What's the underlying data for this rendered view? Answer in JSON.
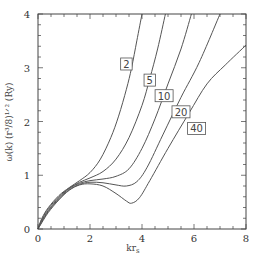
{
  "chart_data": {
    "type": "line",
    "title": "",
    "xlabel": "kr_s",
    "ylabel": "ω(k) (r_s³/8)^{1/2} (Ry)",
    "xlim": [
      0,
      8
    ],
    "ylim": [
      0,
      4
    ],
    "x_ticks": [
      0,
      2,
      4,
      6,
      8
    ],
    "y_ticks": [
      0,
      1,
      2,
      3,
      4
    ],
    "x_minor_step": 0.5,
    "y_minor_step": 0.2,
    "grid": false,
    "legend_position": "inline labels on curves",
    "series": [
      {
        "name": "2",
        "points": [
          [
            0,
            0
          ],
          [
            0.15,
            0.2
          ],
          [
            0.4,
            0.4
          ],
          [
            0.8,
            0.62
          ],
          [
            1.2,
            0.77
          ],
          [
            1.6,
            0.9
          ],
          [
            2.0,
            1.05
          ],
          [
            2.4,
            1.3
          ],
          [
            2.8,
            1.7
          ],
          [
            3.1,
            2.1
          ],
          [
            3.4,
            2.6
          ],
          [
            3.6,
            3.0
          ],
          [
            3.8,
            3.5
          ],
          [
            4.0,
            4.0
          ]
        ],
        "label_at": [
          3.4,
          3.07
        ]
      },
      {
        "name": "5",
        "points": [
          [
            0,
            0
          ],
          [
            0.15,
            0.18
          ],
          [
            0.4,
            0.38
          ],
          [
            0.8,
            0.6
          ],
          [
            1.2,
            0.76
          ],
          [
            1.6,
            0.87
          ],
          [
            2.0,
            0.95
          ],
          [
            2.5,
            1.07
          ],
          [
            3.0,
            1.3
          ],
          [
            3.5,
            1.7
          ],
          [
            4.0,
            2.3
          ],
          [
            4.3,
            2.8
          ],
          [
            4.6,
            3.35
          ],
          [
            4.9,
            4.0
          ]
        ],
        "label_at": [
          4.3,
          2.77
        ]
      },
      {
        "name": "10",
        "points": [
          [
            0,
            0
          ],
          [
            0.15,
            0.16
          ],
          [
            0.4,
            0.35
          ],
          [
            0.8,
            0.58
          ],
          [
            1.2,
            0.75
          ],
          [
            1.6,
            0.85
          ],
          [
            2.0,
            0.9
          ],
          [
            2.5,
            0.93
          ],
          [
            3.0,
            0.98
          ],
          [
            3.5,
            1.12
          ],
          [
            4.0,
            1.5
          ],
          [
            4.5,
            2.05
          ],
          [
            5.0,
            2.7
          ],
          [
            5.5,
            3.35
          ],
          [
            5.9,
            4.0
          ]
        ],
        "label_at": [
          4.85,
          2.48
        ]
      },
      {
        "name": "20",
        "points": [
          [
            0,
            0
          ],
          [
            0.15,
            0.14
          ],
          [
            0.4,
            0.33
          ],
          [
            0.8,
            0.56
          ],
          [
            1.2,
            0.73
          ],
          [
            1.6,
            0.83
          ],
          [
            2.0,
            0.87
          ],
          [
            2.5,
            0.86
          ],
          [
            3.0,
            0.82
          ],
          [
            3.4,
            0.8
          ],
          [
            3.8,
            0.88
          ],
          [
            4.2,
            1.15
          ],
          [
            4.8,
            1.75
          ],
          [
            5.5,
            2.45
          ],
          [
            6.2,
            3.1
          ],
          [
            7.0,
            4.0
          ]
        ],
        "label_at": [
          5.5,
          2.18
        ]
      },
      {
        "name": "40",
        "points": [
          [
            0,
            0
          ],
          [
            0.15,
            0.12
          ],
          [
            0.4,
            0.31
          ],
          [
            0.8,
            0.54
          ],
          [
            1.2,
            0.72
          ],
          [
            1.6,
            0.82
          ],
          [
            2.0,
            0.84
          ],
          [
            2.5,
            0.8
          ],
          [
            3.0,
            0.66
          ],
          [
            3.4,
            0.52
          ],
          [
            3.6,
            0.48
          ],
          [
            3.9,
            0.58
          ],
          [
            4.3,
            0.9
          ],
          [
            5.0,
            1.5
          ],
          [
            5.8,
            2.15
          ],
          [
            6.5,
            2.7
          ],
          [
            7.2,
            3.05
          ],
          [
            8.0,
            3.42
          ]
        ],
        "label_at": [
          6.1,
          1.87
        ]
      }
    ]
  },
  "axes": {
    "x_title": "kr",
    "x_title_sub": "s",
    "y_title": "ω(k)  (r³/8)¹ᐟ²  (Ry)"
  }
}
